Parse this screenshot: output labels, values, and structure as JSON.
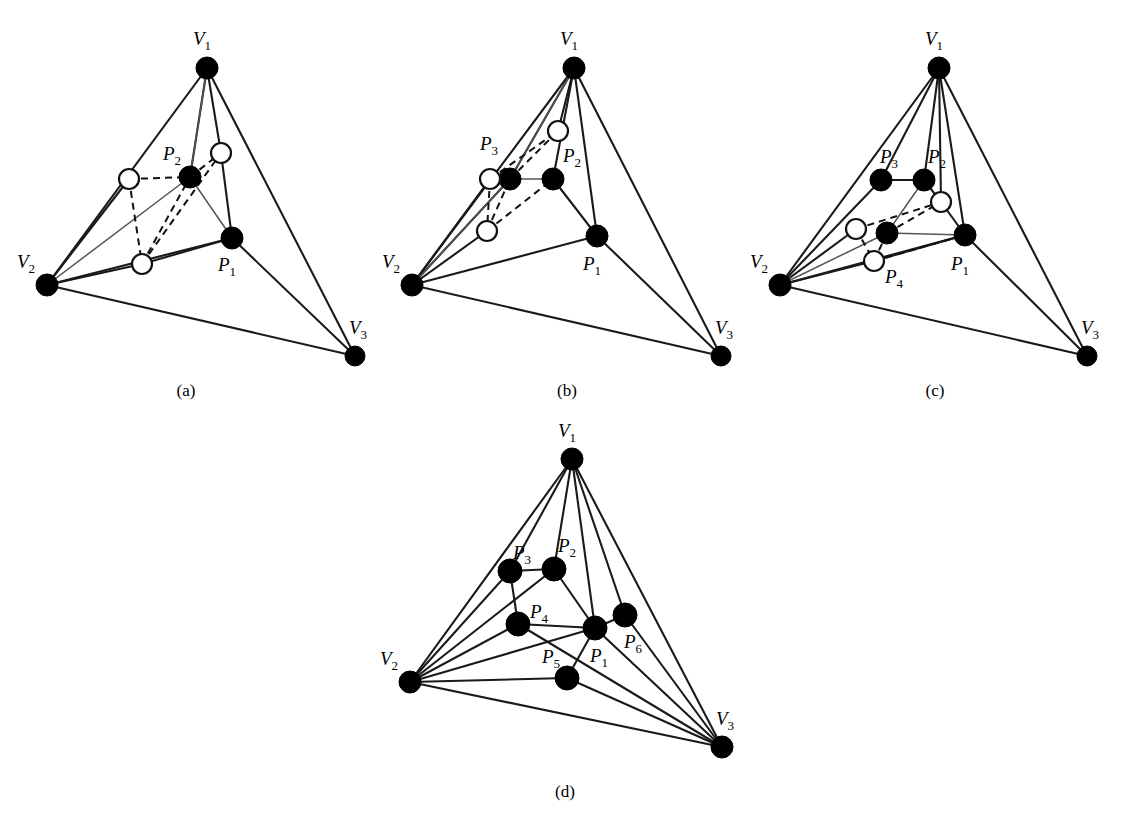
{
  "figure": {
    "background_color": "#ffffff",
    "line_color": "#1a1a1a",
    "node_fill_color": "#000000",
    "node_open_color": "#ffffff",
    "vertex_label_prefix": "V",
    "point_label_prefix": "P",
    "panels": [
      {
        "id": "a",
        "caption": "(a)",
        "caption_pos": [
          186,
          396
        ],
        "vertices": [
          {
            "name": "V1",
            "base": "V",
            "sub": "1",
            "x": 207,
            "y": 68,
            "label_x": 193,
            "label_y": 45,
            "style": "filled",
            "r": 11
          },
          {
            "name": "V2",
            "base": "V",
            "sub": "2",
            "x": 47,
            "y": 285,
            "label_x": 17,
            "label_y": 268,
            "style": "filled",
            "r": 11
          },
          {
            "name": "V3",
            "base": "V",
            "sub": "3",
            "x": 355,
            "y": 356,
            "label_x": 349,
            "label_y": 334,
            "style": "filled",
            "r": 10
          }
        ],
        "points": [
          {
            "name": "P1",
            "base": "P",
            "sub": "1",
            "x": 232,
            "y": 238,
            "label_x": 218,
            "label_y": 271,
            "style": "filled",
            "r": 11
          },
          {
            "name": "P2",
            "base": "P",
            "sub": "2",
            "x": 190,
            "y": 177,
            "label_x": 163,
            "label_y": 160,
            "style": "filled",
            "r": 11
          },
          {
            "name": "Q1",
            "base": "",
            "sub": "",
            "x": 129,
            "y": 179,
            "label_x": null,
            "label_y": null,
            "style": "open",
            "r": 10
          },
          {
            "name": "Q2",
            "base": "",
            "sub": "",
            "x": 221,
            "y": 153,
            "label_x": null,
            "label_y": null,
            "style": "open",
            "r": 10
          },
          {
            "name": "Q3",
            "base": "",
            "sub": "",
            "x": 142,
            "y": 264,
            "label_x": null,
            "label_y": null,
            "style": "open",
            "r": 10
          }
        ],
        "edges_solid": [
          [
            "V1",
            "V2"
          ],
          [
            "V1",
            "V3"
          ],
          [
            "V2",
            "V3"
          ],
          [
            "V1",
            "Q2"
          ],
          [
            "V1",
            "P2"
          ],
          [
            "V2",
            "Q1"
          ],
          [
            "V2",
            "Q3"
          ],
          [
            "V2",
            "P1"
          ],
          [
            "V3",
            "P1"
          ],
          [
            "Q2",
            "P1"
          ],
          [
            "Q3",
            "P1"
          ]
        ],
        "edges_thin": [
          [
            "V1",
            "P2"
          ],
          [
            "V2",
            "P2"
          ],
          [
            "P2",
            "P1"
          ]
        ],
        "edges_dashed": [
          [
            "Q1",
            "P2"
          ],
          [
            "P2",
            "Q2"
          ],
          [
            "Q1",
            "Q3"
          ],
          [
            "Q3",
            "P2"
          ],
          [
            "Q3",
            "Q2"
          ]
        ]
      },
      {
        "id": "b",
        "caption": "(b)",
        "caption_pos": [
          567,
          396
        ],
        "vertices": [
          {
            "name": "V1",
            "base": "V",
            "sub": "1",
            "x": 574,
            "y": 68,
            "label_x": 560,
            "label_y": 45,
            "style": "filled",
            "r": 11
          },
          {
            "name": "V2",
            "base": "V",
            "sub": "2",
            "x": 412,
            "y": 285,
            "label_x": 382,
            "label_y": 268,
            "style": "filled",
            "r": 11
          },
          {
            "name": "V3",
            "base": "V",
            "sub": "3",
            "x": 721,
            "y": 356,
            "label_x": 715,
            "label_y": 334,
            "style": "filled",
            "r": 10
          }
        ],
        "points": [
          {
            "name": "P1",
            "base": "P",
            "sub": "1",
            "x": 597,
            "y": 236,
            "label_x": 583,
            "label_y": 270,
            "style": "filled",
            "r": 11
          },
          {
            "name": "P2",
            "base": "P",
            "sub": "2",
            "x": 553,
            "y": 179,
            "label_x": 563,
            "label_y": 162,
            "style": "filled",
            "r": 11
          },
          {
            "name": "P3",
            "base": "P",
            "sub": "3",
            "x": 510,
            "y": 179,
            "label_x": 480,
            "label_y": 150,
            "style": "filled",
            "r": 11
          },
          {
            "name": "Q1",
            "base": "",
            "sub": "",
            "x": 490,
            "y": 179,
            "label_x": null,
            "label_y": null,
            "style": "open",
            "r": 10
          },
          {
            "name": "Q2",
            "base": "",
            "sub": "",
            "x": 558,
            "y": 131,
            "label_x": null,
            "label_y": null,
            "style": "open",
            "r": 10
          },
          {
            "name": "Q3",
            "base": "",
            "sub": "",
            "x": 487,
            "y": 231,
            "label_x": null,
            "label_y": null,
            "style": "open",
            "r": 10
          }
        ],
        "edges_solid": [
          [
            "V1",
            "V2"
          ],
          [
            "V1",
            "V3"
          ],
          [
            "V2",
            "V3"
          ],
          [
            "V1",
            "Q2"
          ],
          [
            "V1",
            "P2"
          ],
          [
            "V1",
            "P3"
          ],
          [
            "V1",
            "P1"
          ],
          [
            "V2",
            "Q1"
          ],
          [
            "V2",
            "Q3"
          ],
          [
            "V2",
            "P3"
          ],
          [
            "V2",
            "P1"
          ],
          [
            "V3",
            "P1"
          ],
          [
            "P2",
            "P1"
          ]
        ],
        "edges_thin": [
          [
            "V1",
            "P3"
          ],
          [
            "V2",
            "P3"
          ],
          [
            "P3",
            "P2"
          ]
        ],
        "edges_dashed": [
          [
            "P3",
            "Q2"
          ],
          [
            "Q1",
            "Q2"
          ],
          [
            "Q1",
            "Q3"
          ],
          [
            "Q3",
            "P2"
          ],
          [
            "Q3",
            "P3"
          ]
        ]
      },
      {
        "id": "c",
        "caption": "(c)",
        "caption_pos": [
          935,
          396
        ],
        "vertices": [
          {
            "name": "V1",
            "base": "V",
            "sub": "1",
            "x": 939,
            "y": 68,
            "label_x": 925,
            "label_y": 45,
            "style": "filled",
            "r": 11
          },
          {
            "name": "V2",
            "base": "V",
            "sub": "2",
            "x": 780,
            "y": 285,
            "label_x": 750,
            "label_y": 268,
            "style": "filled",
            "r": 11
          },
          {
            "name": "V3",
            "base": "V",
            "sub": "3",
            "x": 1087,
            "y": 356,
            "label_x": 1081,
            "label_y": 334,
            "style": "filled",
            "r": 10
          }
        ],
        "points": [
          {
            "name": "P1",
            "base": "P",
            "sub": "1",
            "x": 965,
            "y": 235,
            "label_x": 951,
            "label_y": 270,
            "style": "filled",
            "r": 11
          },
          {
            "name": "P2",
            "base": "P",
            "sub": "2",
            "x": 924,
            "y": 180,
            "label_x": 928,
            "label_y": 163,
            "style": "filled",
            "r": 11
          },
          {
            "name": "P3",
            "base": "P",
            "sub": "3",
            "x": 881,
            "y": 180,
            "label_x": 880,
            "label_y": 163,
            "style": "filled",
            "r": 11
          },
          {
            "name": "P4",
            "base": "P",
            "sub": "4",
            "x": 887,
            "y": 233,
            "label_x": 885,
            "label_y": 283,
            "style": "filled",
            "r": 11
          },
          {
            "name": "Q1",
            "base": "",
            "sub": "",
            "x": 856,
            "y": 229,
            "label_x": null,
            "label_y": null,
            "style": "open",
            "r": 10
          },
          {
            "name": "Q2",
            "base": "",
            "sub": "",
            "x": 941,
            "y": 202,
            "label_x": null,
            "label_y": null,
            "style": "open",
            "r": 10
          },
          {
            "name": "Q3",
            "base": "",
            "sub": "",
            "x": 874,
            "y": 261,
            "label_x": null,
            "label_y": null,
            "style": "open",
            "r": 10
          }
        ],
        "edges_solid": [
          [
            "V1",
            "V2"
          ],
          [
            "V1",
            "V3"
          ],
          [
            "V2",
            "V3"
          ],
          [
            "V1",
            "P3"
          ],
          [
            "V1",
            "P2"
          ],
          [
            "V1",
            "Q2"
          ],
          [
            "V1",
            "P1"
          ],
          [
            "V2",
            "P3"
          ],
          [
            "V2",
            "Q1"
          ],
          [
            "V2",
            "Q3"
          ],
          [
            "V2",
            "P1"
          ],
          [
            "V3",
            "P1"
          ],
          [
            "P3",
            "P2"
          ],
          [
            "P2",
            "Q2"
          ],
          [
            "Q2",
            "P1"
          ],
          [
            "Q3",
            "P1"
          ]
        ],
        "edges_thin": [
          [
            "P2",
            "P4"
          ],
          [
            "V2",
            "P4"
          ],
          [
            "P4",
            "P1"
          ]
        ],
        "edges_dashed": [
          [
            "Q1",
            "Q2"
          ],
          [
            "P4",
            "Q2"
          ],
          [
            "Q1",
            "Q3"
          ],
          [
            "Q3",
            "P1"
          ],
          [
            "P4",
            "Q3"
          ]
        ]
      },
      {
        "id": "d",
        "caption": "(d)",
        "caption_pos": [
          565,
          797
        ],
        "vertices": [
          {
            "name": "V1",
            "base": "V",
            "sub": "1",
            "x": 572,
            "y": 459,
            "label_x": 558,
            "label_y": 437,
            "style": "filled",
            "r": 11
          },
          {
            "name": "V2",
            "base": "V",
            "sub": "2",
            "x": 410,
            "y": 682,
            "label_x": 380,
            "label_y": 665,
            "style": "filled",
            "r": 11
          },
          {
            "name": "V3",
            "base": "V",
            "sub": "3",
            "x": 722,
            "y": 747,
            "label_x": 716,
            "label_y": 725,
            "style": "filled",
            "r": 11
          }
        ],
        "points": [
          {
            "name": "P1",
            "base": "P",
            "sub": "1",
            "x": 595,
            "y": 628,
            "label_x": 590,
            "label_y": 662,
            "style": "filled",
            "r": 12
          },
          {
            "name": "P2",
            "base": "P",
            "sub": "2",
            "x": 554,
            "y": 569,
            "label_x": 558,
            "label_y": 552,
            "style": "filled",
            "r": 12
          },
          {
            "name": "P3",
            "base": "P",
            "sub": "3",
            "x": 510,
            "y": 571,
            "label_x": 513,
            "label_y": 559,
            "style": "filled",
            "r": 12
          },
          {
            "name": "P4",
            "base": "P",
            "sub": "4",
            "x": 518,
            "y": 624,
            "label_x": 530,
            "label_y": 618,
            "style": "filled",
            "r": 12
          },
          {
            "name": "P5",
            "base": "P",
            "sub": "5",
            "x": 567,
            "y": 678,
            "label_x": 542,
            "label_y": 663,
            "style": "filled",
            "r": 12
          },
          {
            "name": "P6",
            "base": "P",
            "sub": "6",
            "x": 625,
            "y": 615,
            "label_x": 624,
            "label_y": 648,
            "style": "filled",
            "r": 12
          }
        ],
        "edges_solid": [
          [
            "V1",
            "V2"
          ],
          [
            "V1",
            "V3"
          ],
          [
            "V2",
            "V3"
          ],
          [
            "V1",
            "P3"
          ],
          [
            "V1",
            "P2"
          ],
          [
            "V1",
            "P1"
          ],
          [
            "V1",
            "P6"
          ],
          [
            "V2",
            "P3"
          ],
          [
            "V2",
            "P2"
          ],
          [
            "V2",
            "P4"
          ],
          [
            "V2",
            "P1"
          ],
          [
            "V2",
            "P5"
          ],
          [
            "V3",
            "P1"
          ],
          [
            "V3",
            "P6"
          ],
          [
            "V3",
            "P5"
          ],
          [
            "V3",
            "P4"
          ],
          [
            "P3",
            "P2"
          ],
          [
            "P2",
            "P1"
          ],
          [
            "P4",
            "P1"
          ],
          [
            "P1",
            "P6"
          ],
          [
            "P1",
            "P5"
          ],
          [
            "P3",
            "P4"
          ]
        ],
        "edges_thin": [],
        "edges_dashed": []
      }
    ]
  }
}
